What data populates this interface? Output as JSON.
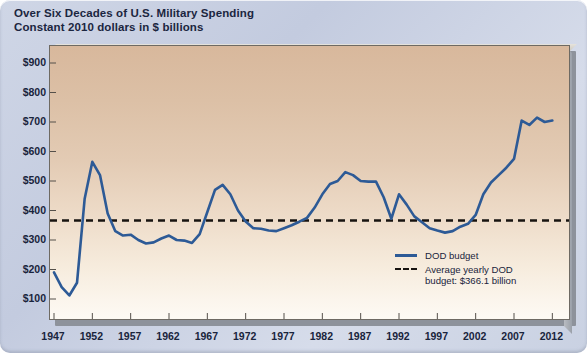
{
  "title": {
    "line1": "Over Six Decades of U.S. Military Spending",
    "line2": "Constant 2010 dollars in $ billions"
  },
  "legend": {
    "series_label": "DOD budget",
    "average_label_line1": "Average yearly DOD",
    "average_label_line2": "budget: $366.1 billion"
  },
  "colors": {
    "line": "#2d5a96",
    "average_line": "#171310",
    "plot_top": "#d8b89c",
    "plot_bottom": "#fdfaf4",
    "page_background": "#c9d1e2",
    "text": "#19243c"
  },
  "chart_data": {
    "type": "line",
    "title": "Over Six Decades of U.S. Military Spending",
    "subtitle": "Constant 2010 dollars in $ billions",
    "xlabel": "",
    "ylabel": "",
    "ylim": [
      100,
      900
    ],
    "xlim": [
      1947,
      2013
    ],
    "grid": false,
    "legend_position": "inside-bottom-right",
    "ytick_labels": [
      "$900",
      "$800",
      "$700",
      "$600",
      "$500",
      "$400",
      "$300",
      "$200",
      "$100"
    ],
    "ytick_values": [
      900,
      800,
      700,
      600,
      500,
      400,
      300,
      200,
      100
    ],
    "xtick_labels": [
      "1947",
      "1952",
      "1957",
      "1962",
      "1967",
      "1972",
      "1977",
      "1982",
      "1987",
      "1992",
      "1997",
      "2002",
      "2007",
      "2012"
    ],
    "xtick_values": [
      1947,
      1952,
      1957,
      1962,
      1967,
      1972,
      1977,
      1982,
      1987,
      1992,
      1997,
      2002,
      2007,
      2012
    ],
    "annotations": [
      {
        "type": "hline",
        "value": 366.1,
        "style": "dashed",
        "label": "Average yearly DOD budget: $366.1 billion"
      }
    ],
    "series": [
      {
        "name": "DOD budget",
        "style": "solid",
        "x": [
          1947,
          1948,
          1949,
          1950,
          1951,
          1952,
          1953,
          1954,
          1955,
          1956,
          1957,
          1958,
          1959,
          1960,
          1961,
          1962,
          1963,
          1964,
          1965,
          1966,
          1967,
          1968,
          1969,
          1970,
          1971,
          1972,
          1973,
          1974,
          1975,
          1976,
          1977,
          1978,
          1979,
          1980,
          1981,
          1982,
          1983,
          1984,
          1985,
          1986,
          1987,
          1988,
          1989,
          1990,
          1991,
          1992,
          1993,
          1994,
          1995,
          1996,
          1997,
          1998,
          1999,
          2000,
          2001,
          2002,
          2003,
          2004,
          2005,
          2006,
          2007,
          2008,
          2009,
          2010,
          2011,
          2012
        ],
        "y": [
          190,
          140,
          112,
          155,
          440,
          565,
          520,
          390,
          330,
          315,
          318,
          300,
          288,
          292,
          305,
          315,
          300,
          298,
          290,
          320,
          395,
          470,
          487,
          455,
          400,
          363,
          340,
          338,
          332,
          330,
          340,
          350,
          362,
          375,
          410,
          455,
          490,
          500,
          530,
          520,
          500,
          498,
          498,
          445,
          372,
          455,
          420,
          380,
          360,
          340,
          332,
          325,
          330,
          345,
          355,
          385,
          455,
          495,
          520,
          545,
          575,
          705,
          690,
          715,
          700,
          705
        ]
      }
    ]
  }
}
